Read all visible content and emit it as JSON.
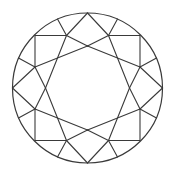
{
  "diagram": {
    "colors": {
      "background": "#ffffff",
      "line": "#3a3a3a"
    },
    "center": [
      87.5,
      88
    ],
    "radius": 75,
    "unit_points_top_left_quadrant": {
      "Q": [
        -0.7,
        -0.7
      ],
      "A": [
        -0.28,
        -0.7
      ],
      "B": [
        -0.7,
        -0.28
      ],
      "S_top": [
        0,
        -0.56
      ],
      "S_left": [
        -0.56,
        0
      ],
      "G_A": [
        -0.4,
        -0.92
      ],
      "G_B": [
        -0.92,
        -0.4
      ],
      "P_top": [
        0,
        -1
      ],
      "P_left": [
        -1,
        0
      ]
    },
    "segments_per_quadrant": [
      [
        "Q",
        "A"
      ],
      [
        "Q",
        "B"
      ],
      [
        "A",
        "G_A"
      ],
      [
        "B",
        "G_B"
      ],
      [
        "A",
        "P_top"
      ],
      [
        "B",
        "P_left"
      ],
      [
        "A",
        "S_top"
      ],
      [
        "B",
        "S_left"
      ],
      [
        "A",
        "S_left"
      ],
      [
        "B",
        "S_top"
      ]
    ]
  }
}
